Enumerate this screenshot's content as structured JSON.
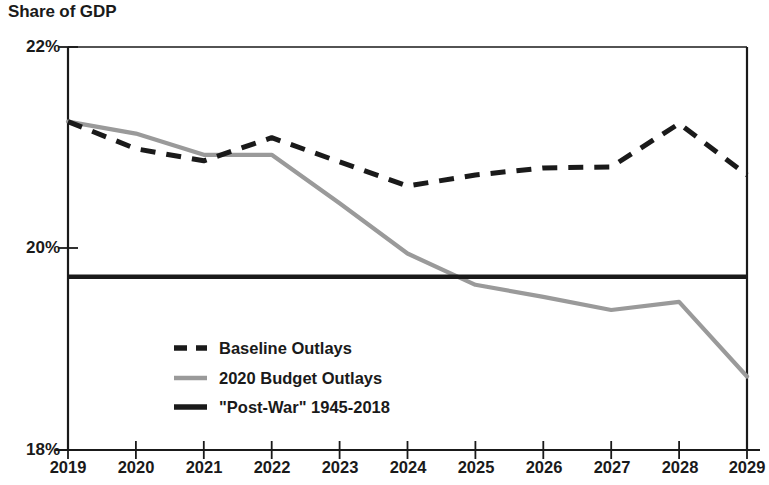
{
  "chart_data": {
    "type": "line",
    "title": "Share of GDP",
    "xlabel": "",
    "ylabel": "",
    "ylim": [
      18,
      22
    ],
    "xlim": [
      2019,
      2029
    ],
    "yticks": [
      "18%",
      "20%",
      "22%"
    ],
    "ytick_values": [
      18,
      20,
      22
    ],
    "grid": false,
    "legend_position": "inside-lower-left",
    "x": [
      2019,
      2020,
      2021,
      2022,
      2023,
      2024,
      2025,
      2026,
      2027,
      2028,
      2029
    ],
    "categories": [
      "2019",
      "2020",
      "2021",
      "2022",
      "2023",
      "2024",
      "2025",
      "2026",
      "2027",
      "2028",
      "2029"
    ],
    "series": [
      {
        "name": "Baseline Outlays",
        "style": "dashed",
        "color": "#1a1a1a",
        "values": [
          21.26,
          20.99,
          20.87,
          21.1,
          20.86,
          20.62,
          20.73,
          20.8,
          20.81,
          21.24,
          20.73
        ]
      },
      {
        "name": "2020 Budget Outlays",
        "style": "solid",
        "color": "#9a9a9a",
        "values": [
          21.26,
          21.14,
          20.93,
          20.93,
          20.45,
          19.95,
          19.64,
          19.52,
          19.39,
          19.47,
          18.73
        ]
      },
      {
        "name": "\"Post-War\" 1945-2018",
        "style": "solid-thick-horizontal",
        "color": "#1a1a1a",
        "constant_value": 19.72
      }
    ]
  },
  "legend": {
    "items": [
      {
        "label": "Baseline Outlays",
        "swatch": "dashed-black-line-swatch"
      },
      {
        "label": "2020 Budget Outlays",
        "swatch": "solid-gray-line-swatch"
      },
      {
        "label": "\"Post-War\" 1945-2018",
        "swatch": "solid-black-line-swatch"
      }
    ]
  },
  "axes": {
    "y_labels": [
      "22%",
      "20%",
      "18%"
    ],
    "x_labels": [
      "2019",
      "2020",
      "2021",
      "2022",
      "2023",
      "2024",
      "2025",
      "2026",
      "2027",
      "2028",
      "2029"
    ]
  },
  "colors": {
    "baseline": "#1a1a1a",
    "budget": "#9a9a9a",
    "postwar": "#1a1a1a",
    "axis": "#1a1a1a",
    "background": "#ffffff"
  }
}
